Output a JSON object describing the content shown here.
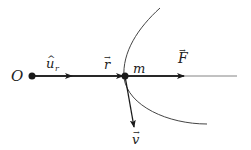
{
  "diagram": {
    "colors": {
      "ink": "#1a1a1a",
      "thin_line": "#555555",
      "background": "#ffffff"
    },
    "labels": {
      "origin": "O",
      "unit_vector_base": "u",
      "unit_vector_hat": "^",
      "unit_vector_sub": "r",
      "position_vector": "r",
      "mass": "m",
      "force": "F",
      "velocity": "v",
      "vector_arrow": "→"
    },
    "elements": [
      {
        "id": "origin-point",
        "kind": "point",
        "label": "O"
      },
      {
        "id": "unit-vector",
        "kind": "vector",
        "label": "û_r",
        "from": "O",
        "direction": "radial"
      },
      {
        "id": "position-vector",
        "kind": "vector",
        "label": "r",
        "from": "O",
        "to": "m"
      },
      {
        "id": "mass-point",
        "kind": "point",
        "label": "m"
      },
      {
        "id": "force-vector",
        "kind": "vector",
        "label": "F",
        "from": "m",
        "direction": "radial outward"
      },
      {
        "id": "velocity-vector",
        "kind": "vector",
        "label": "v",
        "from": "m",
        "direction": "tangent to trajectory"
      },
      {
        "id": "trajectory",
        "kind": "curve",
        "label": ""
      }
    ]
  }
}
